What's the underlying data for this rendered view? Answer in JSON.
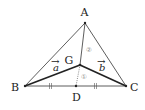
{
  "diagram": {
    "points": {
      "A": {
        "label": "A",
        "x": 85,
        "y": 23
      },
      "B": {
        "label": "B",
        "x": 25,
        "y": 86
      },
      "C": {
        "label": "C",
        "x": 126,
        "y": 86
      },
      "D": {
        "label": "D",
        "x": 76,
        "y": 86
      },
      "G": {
        "label": "G",
        "x": 80,
        "y": 65
      }
    },
    "vectors": {
      "a": {
        "label": "a",
        "arrow": "→",
        "from": "G",
        "to": "B"
      },
      "b": {
        "label": "b",
        "arrow": "→",
        "from": "G",
        "to": "C"
      }
    },
    "ratios": {
      "AG": "②",
      "GD": "①"
    },
    "tick_marks": "||",
    "colors": {
      "line": "#333333",
      "bold_line": "#222222",
      "ratio_circle": "#888888"
    }
  }
}
